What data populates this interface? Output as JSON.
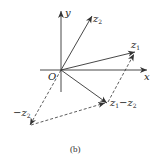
{
  "figure": {
    "caption": "(b)",
    "axes": {
      "x_label": "x",
      "y_label": "y",
      "origin_label": "O"
    },
    "vectors": [
      {
        "name": "z1",
        "label_main": "z",
        "label_sub": "1",
        "style": "solid"
      },
      {
        "name": "z2",
        "label_main": "z",
        "label_sub": "2",
        "style": "solid"
      },
      {
        "name": "z1-z2",
        "label_main_a": "z",
        "label_sub_a": "1",
        "label_op": "−",
        "label_main_b": "z",
        "label_sub_b": "2",
        "style": "solid"
      },
      {
        "name": "-z2",
        "label_prefix": "−",
        "label_main": "z",
        "label_sub": "2",
        "style": "dashed"
      }
    ],
    "colors": {
      "line": "#333333",
      "background": "#ffffff"
    }
  }
}
